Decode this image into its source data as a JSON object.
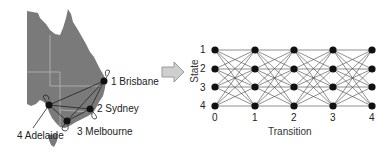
{
  "map": {
    "cities": [
      {
        "index": 1,
        "label": "1 Brisbane"
      },
      {
        "index": 2,
        "label": "2 Sydney"
      },
      {
        "index": 3,
        "label": "3 Melbourne"
      },
      {
        "index": 4,
        "label": "4 Adelaide"
      }
    ],
    "colors": {
      "land": "#7a7a7a",
      "border": "#b8b8b8",
      "node": "#111111"
    }
  },
  "arrow": {
    "color": "#cfcfcf",
    "stroke": "#9a9a9a"
  },
  "trellis": {
    "ylabel": "State",
    "xlabel": "Transition",
    "state_ticks": [
      "1",
      "2",
      "3",
      "4"
    ],
    "transition_ticks": [
      "0",
      "1",
      "2",
      "3",
      "4"
    ]
  }
}
